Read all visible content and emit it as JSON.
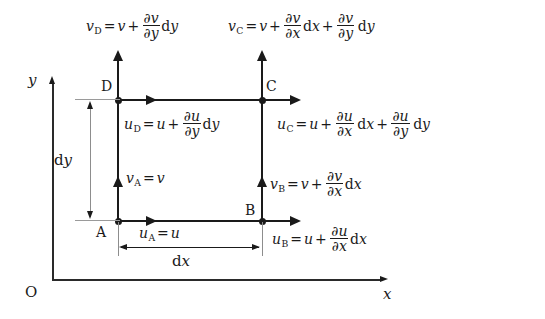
{
  "diagram": {
    "axes": {
      "origin_label": "O",
      "x_label": "x",
      "y_label": "y"
    },
    "vertices": {
      "a": "A",
      "b": "B",
      "c": "C",
      "d": "D"
    },
    "dimensions": {
      "dx": {
        "d": "d",
        "var": "x"
      },
      "dy": {
        "d": "d",
        "var": "y"
      }
    },
    "equations": {
      "v_d": {
        "lhs_var": "v",
        "lhs_sub": "D",
        "eq": "=",
        "base": "v",
        "plus": "+",
        "num": "∂v",
        "den": "∂y",
        "d": "d",
        "diff": "y"
      },
      "v_c": {
        "lhs_var": "v",
        "lhs_sub": "C",
        "eq": "=",
        "base": "v",
        "plus": "+",
        "num1": "∂v",
        "den1": "∂x",
        "d1": "d",
        "diff1": "x",
        "plus2": "+",
        "num2": "∂v",
        "den2": "∂y",
        "d2": "d",
        "diff2": "y"
      },
      "u_d": {
        "lhs_var": "u",
        "lhs_sub": "D",
        "eq": "=",
        "base": "u",
        "plus": "+",
        "num": "∂u",
        "den": "∂y",
        "d": "d",
        "diff": "y"
      },
      "u_c": {
        "lhs_var": "u",
        "lhs_sub": "C",
        "eq": "=",
        "base": "u",
        "plus": "+",
        "num1": "∂u",
        "den1": "∂x",
        "d1": "d",
        "diff1": "x",
        "plus2": "+",
        "num2": "∂u",
        "den2": "∂y",
        "d2": "d",
        "diff2": "y"
      },
      "v_a": {
        "lhs_var": "v",
        "lhs_sub": "A",
        "eq": "=",
        "base": "v"
      },
      "v_b": {
        "lhs_var": "v",
        "lhs_sub": "B",
        "eq": "=",
        "base": "v",
        "plus": "+",
        "num": "∂v",
        "den": "∂x",
        "d": "d",
        "diff": "x"
      },
      "u_a": {
        "lhs_var": "u",
        "lhs_sub": "A",
        "eq": "=",
        "base": "u"
      },
      "u_b": {
        "lhs_var": "u",
        "lhs_sub": "B",
        "eq": "=",
        "base": "u",
        "plus": "+",
        "num": "∂u",
        "den": "∂x",
        "d": "d",
        "diff": "x"
      }
    },
    "colors": {
      "ink": "#1a1a1a",
      "thin_rule": "#9a9a9a",
      "background": "#ffffff"
    }
  }
}
